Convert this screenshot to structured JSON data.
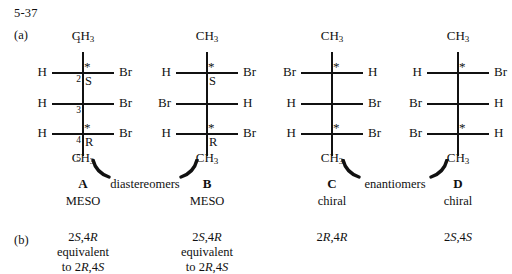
{
  "problem_number": "5-37",
  "part_labels": {
    "a": "(a)",
    "b": "(b)"
  },
  "structures": [
    {
      "id": "A",
      "center_x": 83,
      "top_group": "CH",
      "top_sub": "3",
      "bottom_group": "CH",
      "bottom_sub": "3",
      "carbon_numbers": [
        "1",
        "2",
        "3",
        "4",
        "5"
      ],
      "rows": [
        {
          "left": "H",
          "right": "Br",
          "star": "*",
          "descriptor": "S"
        },
        {
          "left": "H",
          "right": "Br",
          "star": "",
          "descriptor": ""
        },
        {
          "left": "H",
          "right": "Br",
          "star": "*",
          "descriptor": "R"
        }
      ],
      "letter": "A",
      "kind": "MESO",
      "config_lines": [
        "2S,4R",
        "equivalent",
        "to 2R,4S"
      ]
    },
    {
      "id": "B",
      "center_x": 207,
      "top_group": "CH",
      "top_sub": "3",
      "bottom_group": "CH",
      "bottom_sub": "3",
      "carbon_numbers": [
        "",
        "",
        "",
        "",
        ""
      ],
      "rows": [
        {
          "left": "H",
          "right": "Br",
          "star": "*",
          "descriptor": "S"
        },
        {
          "left": "Br",
          "right": "H",
          "star": "",
          "descriptor": ""
        },
        {
          "left": "H",
          "right": "Br",
          "star": "*",
          "descriptor": "R"
        }
      ],
      "letter": "B",
      "kind": "MESO",
      "config_lines": [
        "2S,4R",
        "equivalent",
        "to 2R,4S"
      ]
    },
    {
      "id": "C",
      "center_x": 332,
      "top_group": "CH",
      "top_sub": "3",
      "bottom_group": "CH",
      "bottom_sub": "3",
      "carbon_numbers": [
        "",
        "",
        "",
        "",
        ""
      ],
      "rows": [
        {
          "left": "Br",
          "right": "H",
          "star": "*",
          "descriptor": ""
        },
        {
          "left": "H",
          "right": "Br",
          "star": "",
          "descriptor": ""
        },
        {
          "left": "H",
          "right": "Br",
          "star": "*",
          "descriptor": ""
        }
      ],
      "letter": "C",
      "kind": "chiral",
      "config_lines": [
        "2R,4R"
      ]
    },
    {
      "id": "D",
      "center_x": 458,
      "top_group": "CH",
      "top_sub": "3",
      "bottom_group": "CH",
      "bottom_sub": "3",
      "carbon_numbers": [
        "",
        "",
        "",
        "",
        ""
      ],
      "rows": [
        {
          "left": "H",
          "right": "Br",
          "star": "*",
          "descriptor": ""
        },
        {
          "left": "Br",
          "right": "H",
          "star": "",
          "descriptor": ""
        },
        {
          "left": "Br",
          "right": "H",
          "star": "*",
          "descriptor": ""
        }
      ],
      "letter": "D",
      "kind": "chiral",
      "config_lines": [
        "2S,4S"
      ]
    }
  ],
  "relationships": [
    {
      "label": "diastereomers",
      "center_x": 145
    },
    {
      "label": "enantiomers",
      "center_x": 395
    }
  ],
  "colors": {
    "ink": "#111111",
    "background": "#ffffff"
  }
}
